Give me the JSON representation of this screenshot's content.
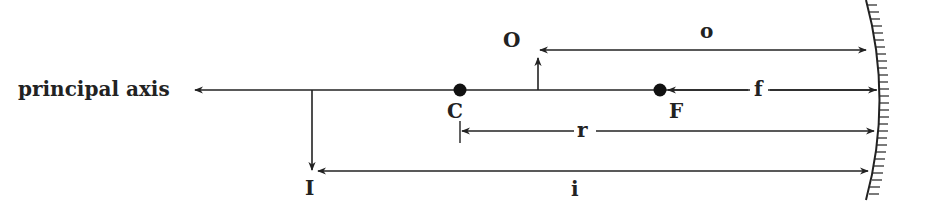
{
  "diagram": {
    "type": "concave mirror ray geometry",
    "labels": {
      "axis": "principal axis",
      "object": "O",
      "image": "I",
      "center": "C",
      "focus": "F",
      "object_distance": "o",
      "focal_length": "f",
      "radius": "r",
      "image_distance": "i"
    },
    "colors": {
      "line": "#222222",
      "background": "#ffffff"
    }
  }
}
